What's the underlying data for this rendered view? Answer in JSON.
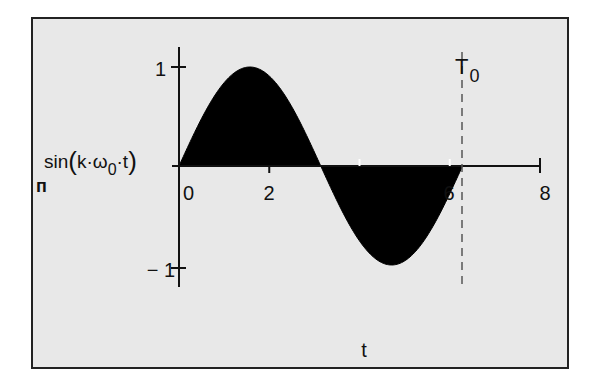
{
  "chart_data": {
    "type": "area",
    "title": "",
    "function": "sin(k·ω0·t)",
    "xlabel": "t",
    "ylabel": "sin(k·ω0·t)",
    "ylabel_parts": {
      "prefix": "sin",
      "open": "(",
      "body": "k·ω",
      "sub": "0",
      "suffix": "·t",
      "close": ")"
    },
    "xlim": [
      0,
      8
    ],
    "ylim": [
      -1,
      1
    ],
    "x_ticks": [
      0,
      2,
      4,
      6,
      8
    ],
    "x_tick_labels": [
      "0",
      "2",
      "4",
      "6",
      "8"
    ],
    "y_ticks": [
      -1,
      1
    ],
    "y_tick_labels": [
      "− 1",
      "1"
    ],
    "grid": false,
    "legend": null,
    "series": [
      {
        "name": "sin(k·ω0·t)",
        "fill": "#000000",
        "x_range": [
          0,
          6.283
        ],
        "x": [
          0,
          0.785,
          1.571,
          2.356,
          3.142,
          3.927,
          4.712,
          5.498,
          6.283
        ],
        "values": [
          0,
          0.707,
          1,
          0.707,
          0,
          -0.707,
          -1,
          -0.707,
          0
        ]
      }
    ],
    "annotations": [
      {
        "type": "vertical-dashed-line",
        "x": 6.283,
        "label": "T",
        "label_sub": "0"
      }
    ],
    "background": "#e8e8e8",
    "frame_color": "#222222"
  },
  "annotations": {
    "period_marker": "T",
    "period_marker_sub": "0",
    "corner_glyph": "п"
  }
}
